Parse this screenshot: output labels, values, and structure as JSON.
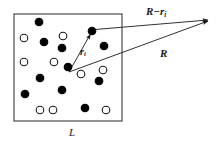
{
  "figure": {
    "background_color": "#ffffff",
    "line_color": "#1a1a1a",
    "filled_particle_color": "#000000",
    "open_particle_color": "#ffffff"
  },
  "labels": {
    "r_minus": "R",
    "r_minus_op": "−",
    "r_minus_sub_base": "r",
    "r_minus_sub_index": "i",
    "R": "R",
    "ri_base": "r",
    "ri_index": "i",
    "L": "L"
  },
  "box": {
    "x": 14,
    "y": 14,
    "width": 108,
    "height": 107,
    "stroke_width": 1.2,
    "side_label": "L"
  },
  "vectors": [
    {
      "name": "r_i",
      "label": "r i",
      "from": [
        69,
        72
      ],
      "to": [
        92,
        31
      ],
      "arrowhead": true
    },
    {
      "name": "R",
      "label": "R",
      "from": [
        69,
        72
      ],
      "to": [
        210,
        20
      ],
      "arrowhead": true
    },
    {
      "name": "R_minus_r_i",
      "label": "R − r i",
      "from": [
        94,
        30
      ],
      "to": [
        210,
        20
      ],
      "arrowhead": true
    }
  ],
  "particles": {
    "radius": 3.8,
    "stroke_width": 1.1,
    "filled": [
      [
        39,
        22
      ],
      [
        44,
        42
      ],
      [
        62,
        48
      ],
      [
        92,
        31
      ],
      [
        104,
        46
      ],
      [
        40,
        78
      ],
      [
        68,
        67
      ],
      [
        25,
        94
      ],
      [
        62,
        90
      ],
      [
        99,
        81
      ],
      [
        85,
        108
      ]
    ],
    "open": [
      [
        24,
        38
      ],
      [
        63,
        36
      ],
      [
        24,
        62
      ],
      [
        54,
        62
      ],
      [
        81,
        74
      ],
      [
        103,
        70
      ],
      [
        40,
        110
      ],
      [
        53,
        110
      ],
      [
        106,
        110
      ]
    ]
  }
}
